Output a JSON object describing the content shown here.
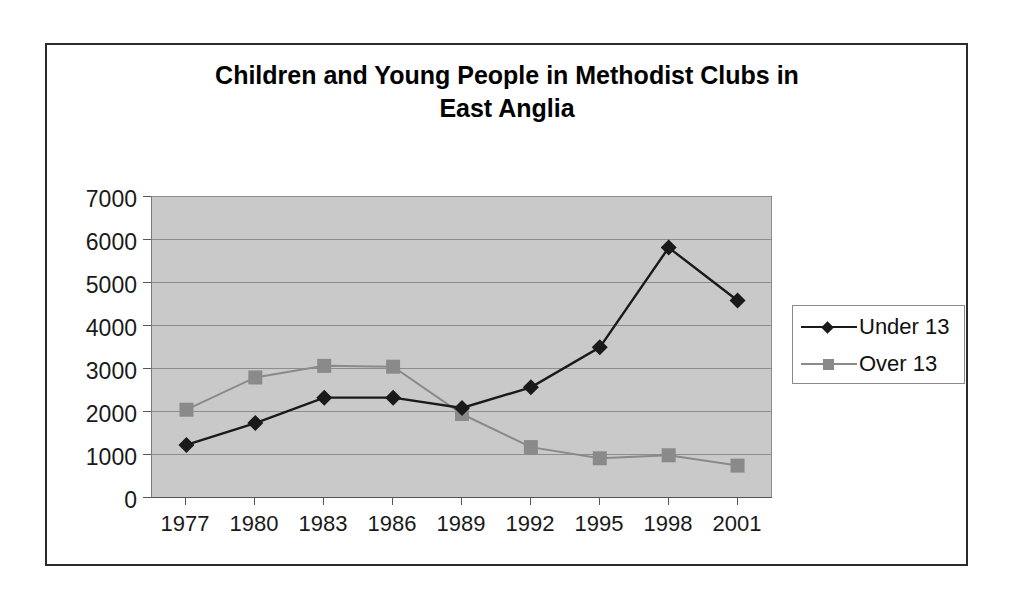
{
  "chart_data": {
    "type": "line",
    "title": "Children and Young People in Methodist Clubs in East Anglia",
    "title_line1": "Children and Young People in Methodist Clubs in",
    "title_line2": "East Anglia",
    "xlabel": "",
    "ylabel": "",
    "categories": [
      "1977",
      "1980",
      "1983",
      "1986",
      "1989",
      "1992",
      "1995",
      "1998",
      "2001"
    ],
    "ylim": [
      0,
      7000
    ],
    "ytick_labels": [
      "7000",
      "6000",
      "5000",
      "4000",
      "3000",
      "2000",
      "1000",
      "0"
    ],
    "ytick_values": [
      7000,
      6000,
      5000,
      4000,
      3000,
      2000,
      1000,
      0
    ],
    "grid": true,
    "legend_position": "right",
    "series": [
      {
        "name": "Under 13",
        "marker": "diamond",
        "color": "#1a1a1a",
        "values": [
          1210,
          1720,
          2310,
          2310,
          2070,
          2550,
          3480,
          5800,
          4570
        ]
      },
      {
        "name": "Over 13",
        "marker": "square",
        "color": "#8a8a8a",
        "values": [
          2030,
          2780,
          3050,
          3030,
          1930,
          1160,
          900,
          970,
          730
        ]
      }
    ]
  },
  "style": {
    "plot_background": "#c9c9c9",
    "gridline_color": "#8d8d8d",
    "frame_color": "#2b2b2b",
    "text_color": "#1a1a1a"
  }
}
